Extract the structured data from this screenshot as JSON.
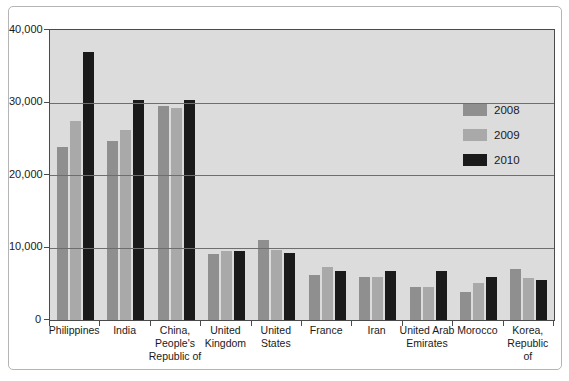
{
  "figure": {
    "background_color": "#ffffff",
    "frame_border_color": "#b5b5b5",
    "plot_background_color": "#dcdcdc",
    "axis_color": "#4a4a4a",
    "gridline_color": "#6e6e6e"
  },
  "chart_data": {
    "type": "bar",
    "title": "",
    "xlabel": "",
    "ylabel": "",
    "categories": [
      "Philippines",
      "India",
      "China, People's Republic of",
      "United Kingdom",
      "United States",
      "France",
      "Iran",
      "United Arab Emirates",
      "Morocco",
      "Korea, Republic of"
    ],
    "category_display": [
      "Philippines",
      "India",
      "China,\nPeople's\nRepublic of",
      "United\nKingdom",
      "United\nStates",
      "France",
      "Iran",
      "United Arab\nEmirates",
      "Morocco",
      "Korea,\nRepublic of"
    ],
    "series": [
      {
        "name": "2008",
        "color": "#8f8f8f",
        "values": [
          23800,
          24700,
          29500,
          9100,
          11100,
          6200,
          5900,
          4600,
          3800,
          7100
        ]
      },
      {
        "name": "2009",
        "color": "#a9a9a9",
        "values": [
          27400,
          26200,
          29200,
          9500,
          9700,
          7300,
          6000,
          4500,
          5100,
          5800
        ]
      },
      {
        "name": "2010",
        "color": "#1a1a1a",
        "values": [
          36900,
          30400,
          30400,
          9500,
          9200,
          6800,
          6800,
          6700,
          6000,
          5500
        ]
      }
    ],
    "ylim": [
      0,
      40000
    ],
    "yticks": {
      "values": [
        0,
        10000,
        20000,
        30000,
        40000
      ],
      "labels": [
        "0",
        "10,000",
        "20,000",
        "30,000",
        "40,000"
      ]
    },
    "grid": "horizontal",
    "legend_position": "inside-right",
    "legend_entries": [
      "2008",
      "2009",
      "2010"
    ]
  }
}
